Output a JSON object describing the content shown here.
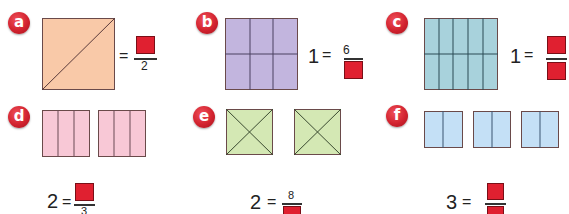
{
  "questions": {
    "a": {
      "label": "a",
      "whole": "",
      "equals": "=",
      "numerator": "",
      "denominator": "2",
      "shape": "square split diagonally into 2 triangles",
      "fill": "#f9c9a8"
    },
    "b": {
      "label": "b",
      "whole": "1",
      "equals": "=",
      "numerator": "6",
      "denominator": "",
      "shape": "square split into 6 parts (3x2)",
      "fill": "#c2b5de"
    },
    "c": {
      "label": "c",
      "whole": "1",
      "equals": "=",
      "numerator": "",
      "denominator": "",
      "shape": "square split into 10 parts (5x2)",
      "fill": "#a8d2dc"
    },
    "d": {
      "label": "d",
      "whole": "2",
      "equals": "=",
      "numerator": "",
      "denominator": "3",
      "shape": "2 rectangles each split into 3",
      "fill": "#f8c8d6"
    },
    "e": {
      "label": "e",
      "whole": "2",
      "equals": "=",
      "numerator": "8",
      "denominator": "",
      "shape": "2 squares each split into 4 triangles",
      "fill": "#d4e8b4"
    },
    "f": {
      "label": "f",
      "whole": "3",
      "equals": "=",
      "numerator": "",
      "denominator": "",
      "shape": "3 rectangles each split into 2",
      "fill": "#c4e0f6"
    }
  },
  "colors": {
    "answer_box": "#e02030",
    "badge": "#d2232f",
    "outline": "#6a4a4a"
  }
}
